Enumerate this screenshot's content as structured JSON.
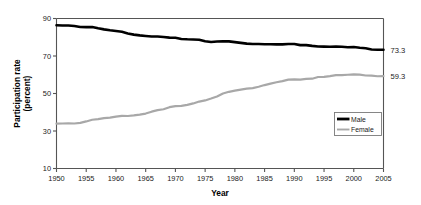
{
  "chart_data": {
    "type": "line",
    "title": "",
    "xlabel": "Year",
    "ylabel": "Participation rate (percent)",
    "ylabel_line1": "Participation rate",
    "ylabel_line2": "(percent)",
    "xlim": [
      1950,
      2005
    ],
    "ylim": [
      10,
      90
    ],
    "yticks": [
      10,
      30,
      50,
      70,
      90
    ],
    "xticks": [
      1950,
      1955,
      1960,
      1965,
      1970,
      1975,
      1980,
      1985,
      1990,
      1995,
      2000,
      2005
    ],
    "grid": false,
    "legend_position": "lower-right-inside",
    "x": [
      1950,
      1951,
      1952,
      1953,
      1954,
      1955,
      1956,
      1957,
      1958,
      1959,
      1960,
      1961,
      1962,
      1963,
      1964,
      1965,
      1966,
      1967,
      1968,
      1969,
      1970,
      1971,
      1972,
      1973,
      1974,
      1975,
      1976,
      1977,
      1978,
      1979,
      1980,
      1981,
      1982,
      1983,
      1984,
      1985,
      1986,
      1987,
      1988,
      1989,
      1990,
      1991,
      1992,
      1993,
      1994,
      1995,
      1996,
      1997,
      1998,
      1999,
      2000,
      2001,
      2002,
      2003,
      2004,
      2005
    ],
    "series": [
      {
        "name": "Male",
        "color": "#000000",
        "line_width": 2.6,
        "end_label": "73.3",
        "values": [
          86.4,
          86.3,
          86.3,
          86.0,
          85.5,
          85.4,
          85.5,
          84.8,
          84.2,
          83.7,
          83.3,
          82.9,
          82.0,
          81.4,
          81.0,
          80.7,
          80.4,
          80.4,
          80.1,
          79.8,
          79.7,
          79.1,
          78.9,
          78.8,
          78.7,
          77.9,
          77.5,
          77.7,
          77.9,
          77.8,
          77.4,
          77.0,
          76.6,
          76.4,
          76.4,
          76.3,
          76.3,
          76.2,
          76.2,
          76.4,
          76.4,
          75.8,
          75.8,
          75.4,
          75.1,
          75.0,
          74.9,
          75.0,
          74.9,
          74.7,
          74.8,
          74.4,
          74.1,
          73.5,
          73.3,
          73.3
        ]
      },
      {
        "name": "Female",
        "color": "#a8a8a8",
        "line_width": 2.2,
        "end_label": "59.3",
        "values": [
          33.9,
          34.0,
          34.1,
          34.0,
          34.3,
          35.1,
          36.0,
          36.3,
          36.9,
          37.1,
          37.7,
          38.1,
          38.0,
          38.3,
          38.7,
          39.3,
          40.3,
          41.1,
          41.6,
          42.7,
          43.3,
          43.4,
          43.9,
          44.7,
          45.7,
          46.3,
          47.3,
          48.4,
          50.0,
          50.9,
          51.5,
          52.1,
          52.6,
          52.9,
          53.6,
          54.5,
          55.3,
          56.0,
          56.6,
          57.4,
          57.5,
          57.4,
          57.8,
          57.9,
          58.8,
          58.9,
          59.3,
          59.8,
          59.8,
          60.0,
          60.2,
          60.1,
          59.6,
          59.5,
          59.2,
          59.3
        ]
      }
    ]
  },
  "legend": {
    "items": [
      {
        "label": "Male",
        "color": "#000000"
      },
      {
        "label": "Female",
        "color": "#a8a8a8"
      }
    ]
  },
  "axes": {
    "y_title_line1": "Participation rate",
    "y_title_line2": "(percent)",
    "x_title": "Year",
    "y_tick_labels": [
      "90",
      "70",
      "50",
      "30",
      "10"
    ],
    "x_tick_labels": [
      "1950",
      "1955",
      "1960",
      "1965",
      "1970",
      "1975",
      "1980",
      "1985",
      "1990",
      "1995",
      "2000",
      "2005"
    ]
  },
  "endpoint_labels": {
    "male": "73.3",
    "female": "59.3"
  },
  "colors": {
    "male_line": "#000000",
    "female_line": "#a8a8a8",
    "axis": "#555555",
    "text": "#1a1a1a",
    "background": "#ffffff"
  }
}
